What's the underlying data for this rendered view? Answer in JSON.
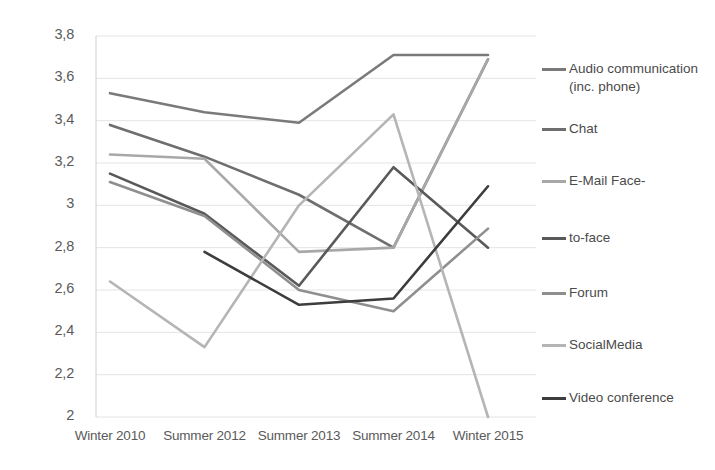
{
  "chart_data": {
    "type": "line",
    "title": "",
    "xlabel": "",
    "ylabel": "",
    "categories": [
      "Winter 2010",
      "Summer 2012",
      "Summer 2013",
      "Summer 2014",
      "Winter 2015"
    ],
    "ylim": [
      2,
      3.8
    ],
    "ytick_labels": [
      "3,8",
      "3,6",
      "3,4",
      "3,2",
      "3",
      "2,8",
      "2,6",
      "2,4",
      "2,2",
      "2"
    ],
    "ytick_values": [
      3.8,
      3.6,
      3.4,
      3.2,
      3.0,
      2.8,
      2.6,
      2.4,
      2.2,
      2.0
    ],
    "decimal_separator": ",",
    "grid": true,
    "grid_color": "#e4e4e4",
    "legend_position": "right",
    "series": [
      {
        "name": "Audio communication (inc. phone)",
        "color": "#7a7a7a",
        "values": [
          3.53,
          3.44,
          3.39,
          3.71,
          3.71
        ]
      },
      {
        "name": "Chat",
        "color": "#6e6e6e",
        "values": [
          3.38,
          3.23,
          3.05,
          2.8,
          3.69
        ]
      },
      {
        "name": "E-Mail",
        "color": "#a8a8a8",
        "values": [
          3.24,
          3.22,
          2.78,
          2.8,
          3.69
        ]
      },
      {
        "name": "Face-to-face",
        "color": "#595959",
        "values": [
          3.15,
          2.96,
          2.62,
          3.18,
          2.8
        ]
      },
      {
        "name": "Forum",
        "color": "#8f8f8f",
        "values": [
          3.11,
          2.95,
          2.6,
          2.5,
          2.89
        ]
      },
      {
        "name": "SocialMedia",
        "color": "#b5b5b5",
        "values": [
          2.64,
          2.33,
          3.0,
          3.43,
          2.0
        ]
      },
      {
        "name": "Video conference",
        "color": "#3d3d3d",
        "values": [
          null,
          2.78,
          2.53,
          2.56,
          3.09
        ]
      }
    ]
  },
  "legend": {
    "entries": [
      {
        "label": "Audio communication (inc. phone)",
        "color": "#7a7a7a"
      },
      {
        "label": "Chat",
        "color": "#6e6e6e"
      },
      {
        "label": "E-Mail Face-",
        "color": "#a8a8a8"
      },
      {
        "label": "to-face",
        "color": "#595959"
      },
      {
        "label": "Forum",
        "color": "#8f8f8f"
      },
      {
        "label": "SocialMedia",
        "color": "#b5b5b5"
      },
      {
        "label": "Video conference",
        "color": "#3d3d3d"
      }
    ]
  }
}
